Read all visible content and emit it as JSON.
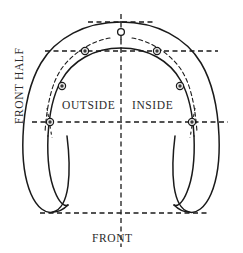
{
  "figure": {
    "type": "horseshoe-nail-placement-diagram",
    "labels": {
      "front_half": "FRONT HALF",
      "outside": "OUTSIDE",
      "inside": "INSIDE",
      "front": "FRONT"
    },
    "colors": {
      "outline": "#1a1a1a",
      "guide_line": "#1a1a1a",
      "text": "#2b2b2b",
      "marker_fill": "#3a3a3a",
      "background": "#ffffff"
    },
    "geometry": {
      "center_x": 121,
      "toe_top_y": 22,
      "heel_bottom_y": 213,
      "mid_line_y": 122,
      "upper_line_y": 51
    },
    "toe_hole": {
      "name": "toe-clip-hole",
      "cx": 121,
      "cy": 32,
      "r": 3.4
    },
    "nail_holes": [
      {
        "side": "outside",
        "index": 1,
        "cx": 85,
        "cy": 51
      },
      {
        "side": "outside",
        "index": 2,
        "cx": 62,
        "cy": 86
      },
      {
        "side": "outside",
        "index": 3,
        "cx": 50,
        "cy": 122
      },
      {
        "side": "inside",
        "index": 1,
        "cx": 157,
        "cy": 51
      },
      {
        "side": "inside",
        "index": 2,
        "cx": 180,
        "cy": 86
      },
      {
        "side": "inside",
        "index": 3,
        "cx": 192,
        "cy": 122
      }
    ],
    "guide_lines": [
      {
        "name": "vertical-center-line",
        "orientation": "vertical",
        "x1": 121,
        "y1": 14,
        "x2": 121,
        "y2": 247
      },
      {
        "name": "toe-tangent-line",
        "orientation": "horizontal",
        "x1": 88,
        "y1": 22,
        "x2": 155,
        "y2": 22
      },
      {
        "name": "upper-nail-line",
        "orientation": "horizontal",
        "x1": 45,
        "y1": 51,
        "x2": 218,
        "y2": 51
      },
      {
        "name": "mid-quarter-line",
        "orientation": "horizontal",
        "x1": 32,
        "y1": 122,
        "x2": 228,
        "y2": 122
      },
      {
        "name": "heel-baseline",
        "orientation": "horizontal",
        "x1": 40,
        "y1": 213,
        "x2": 210,
        "y2": 213
      }
    ]
  }
}
